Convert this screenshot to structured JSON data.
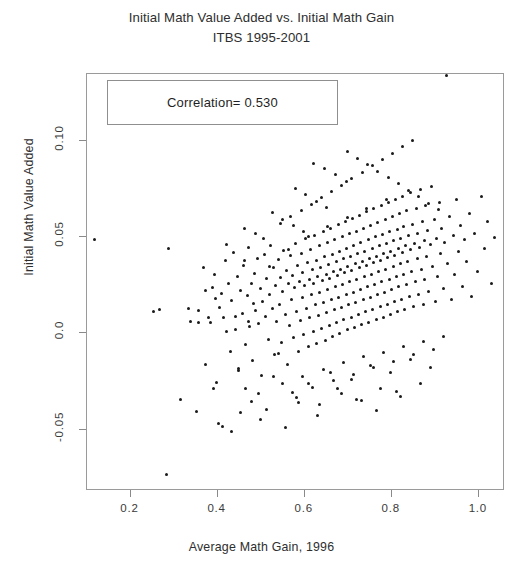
{
  "chart_data": {
    "type": "scatter",
    "title": "Initial Math Value Added vs. Initial Math Gain",
    "subtitle": "ITBS 1995-2001",
    "xlabel": "Average Math Gain, 1996",
    "ylabel": "Initial Math Value Added",
    "xlim": [
      0.1,
      1.06
    ],
    "ylim": [
      -0.082,
      0.135
    ],
    "xticks": [
      0.2,
      0.4,
      0.6,
      0.8,
      1.0
    ],
    "xticklabels": [
      "0.2",
      "0.4",
      "0.6",
      "0.8",
      "1.0"
    ],
    "yticks": [
      -0.05,
      0.0,
      0.05,
      0.1
    ],
    "yticklabels": [
      "-0.05",
      "0.0",
      "0.05",
      "0.10"
    ],
    "grid": false,
    "legend": null,
    "annotations": [
      {
        "name": "correlation-box",
        "text": "Correlation= 0.530",
        "x_px": 107,
        "y_px": 80,
        "w_px": 231,
        "h_px": 45
      }
    ],
    "marker": {
      "shape": "circle",
      "size_px": 3,
      "color": "#1a1a1a"
    },
    "frame_color": "#9a9a9a",
    "background": "#ffffff",
    "n_points": 381,
    "correlation": 0.53,
    "points": [
      [
        0.118,
        0.0487
      ],
      [
        0.288,
        0.0443
      ],
      [
        0.283,
        -0.0735
      ],
      [
        0.315,
        -0.0345
      ],
      [
        0.352,
        -0.0404
      ],
      [
        0.372,
        -0.0161
      ],
      [
        0.383,
        0.0058
      ],
      [
        0.388,
        0.0239
      ],
      [
        0.392,
        0.0305
      ],
      [
        0.398,
        -0.0255
      ],
      [
        0.404,
        0.0135
      ],
      [
        0.409,
        0.021
      ],
      [
        0.413,
        0.0082
      ],
      [
        0.418,
        0.0378
      ],
      [
        0.421,
        0.0008
      ],
      [
        0.425,
        0.0262
      ],
      [
        0.429,
        -0.0095
      ],
      [
        0.433,
        0.017
      ],
      [
        0.437,
        0.042
      ],
      [
        0.441,
        0.0018
      ],
      [
        0.445,
        0.0298
      ],
      [
        0.449,
        -0.018
      ],
      [
        0.452,
        0.0225
      ],
      [
        0.456,
        0.0104
      ],
      [
        0.46,
        0.0355
      ],
      [
        0.464,
        -0.006
      ],
      [
        0.468,
        0.0198
      ],
      [
        0.47,
        0.0445
      ],
      [
        0.474,
        0.0036
      ],
      [
        0.478,
        0.026
      ],
      [
        0.481,
        -0.014
      ],
      [
        0.485,
        0.0312
      ],
      [
        0.488,
        0.012
      ],
      [
        0.492,
        0.0392
      ],
      [
        0.495,
        0.0052
      ],
      [
        0.498,
        0.0232
      ],
      [
        0.501,
        -0.0218
      ],
      [
        0.504,
        0.0168
      ],
      [
        0.507,
        0.041
      ],
      [
        0.51,
        0.0088
      ],
      [
        0.513,
        0.0288
      ],
      [
        0.516,
        -0.0032
      ],
      [
        0.519,
        0.0205
      ],
      [
        0.522,
        0.046
      ],
      [
        0.525,
        0.0128
      ],
      [
        0.528,
        0.0342
      ],
      [
        0.531,
        -0.0108
      ],
      [
        0.534,
        0.0248
      ],
      [
        0.536,
        0.0062
      ],
      [
        0.539,
        0.0385
      ],
      [
        0.542,
        0.0152
      ],
      [
        0.545,
        0.0292
      ],
      [
        0.547,
        -0.0048
      ],
      [
        0.55,
        0.0218
      ],
      [
        0.552,
        0.0432
      ],
      [
        0.555,
        0.0098
      ],
      [
        0.558,
        0.0328
      ],
      [
        0.56,
        -0.0162
      ],
      [
        0.562,
        0.0258
      ],
      [
        0.565,
        0.0042
      ],
      [
        0.567,
        0.0405
      ],
      [
        0.57,
        0.0178
      ],
      [
        0.572,
        0.0302
      ],
      [
        0.574,
        -0.0022
      ],
      [
        0.577,
        0.0238
      ],
      [
        0.579,
        0.0468
      ],
      [
        0.581,
        0.0112
      ],
      [
        0.583,
        0.0352
      ],
      [
        0.586,
        -0.0092
      ],
      [
        0.588,
        0.0272
      ],
      [
        0.59,
        0.0068
      ],
      [
        0.592,
        0.0418
      ],
      [
        0.594,
        0.0188
      ],
      [
        0.596,
        0.0315
      ],
      [
        0.598,
        -0.0005
      ],
      [
        0.6,
        0.0248
      ],
      [
        0.602,
        0.0492
      ],
      [
        0.604,
        0.0132
      ],
      [
        0.606,
        0.0368
      ],
      [
        0.608,
        -0.007
      ],
      [
        0.61,
        0.0282
      ],
      [
        0.612,
        0.0082
      ],
      [
        0.614,
        0.0438
      ],
      [
        0.616,
        0.0202
      ],
      [
        0.618,
        0.0332
      ],
      [
        0.62,
        0.0012
      ],
      [
        0.621,
        0.0262
      ],
      [
        0.623,
        0.0512
      ],
      [
        0.625,
        0.0148
      ],
      [
        0.627,
        0.0382
      ],
      [
        0.628,
        -0.0052
      ],
      [
        0.63,
        0.0298
      ],
      [
        0.632,
        0.0095
      ],
      [
        0.634,
        0.0455
      ],
      [
        0.635,
        0.0215
      ],
      [
        0.637,
        0.0345
      ],
      [
        0.639,
        0.0028
      ],
      [
        0.64,
        0.0275
      ],
      [
        0.642,
        0.053
      ],
      [
        0.644,
        0.0162
      ],
      [
        0.645,
        0.0398
      ],
      [
        0.647,
        -0.0035
      ],
      [
        0.649,
        0.0308
      ],
      [
        0.65,
        0.0108
      ],
      [
        0.652,
        0.0472
      ],
      [
        0.653,
        0.0228
      ],
      [
        0.655,
        0.0358
      ],
      [
        0.657,
        0.0042
      ],
      [
        0.658,
        0.0288
      ],
      [
        0.66,
        0.0548
      ],
      [
        0.661,
        0.0175
      ],
      [
        0.663,
        0.0412
      ],
      [
        0.664,
        -0.0018
      ],
      [
        0.666,
        0.0322
      ],
      [
        0.668,
        0.0122
      ],
      [
        0.669,
        0.0488
      ],
      [
        0.671,
        0.0242
      ],
      [
        0.672,
        0.0372
      ],
      [
        0.674,
        0.0058
      ],
      [
        0.675,
        0.0302
      ],
      [
        0.677,
        0.0565
      ],
      [
        0.678,
        0.0188
      ],
      [
        0.68,
        0.0428
      ],
      [
        0.681,
        0.0002
      ],
      [
        0.683,
        0.0335
      ],
      [
        0.684,
        0.0135
      ],
      [
        0.686,
        0.0502
      ],
      [
        0.687,
        0.0255
      ],
      [
        0.689,
        0.0388
      ],
      [
        0.69,
        0.0072
      ],
      [
        0.692,
        0.0315
      ],
      [
        0.693,
        0.0582
      ],
      [
        0.695,
        0.0202
      ],
      [
        0.696,
        0.0442
      ],
      [
        0.698,
        0.0018
      ],
      [
        0.699,
        0.0348
      ],
      [
        0.701,
        0.0148
      ],
      [
        0.702,
        0.0518
      ],
      [
        0.704,
        0.0268
      ],
      [
        0.705,
        0.0402
      ],
      [
        0.707,
        0.0085
      ],
      [
        0.708,
        0.0328
      ],
      [
        0.71,
        0.0598
      ],
      [
        0.711,
        0.0215
      ],
      [
        0.713,
        0.0458
      ],
      [
        0.714,
        0.0032
      ],
      [
        0.716,
        0.0362
      ],
      [
        0.717,
        0.0162
      ],
      [
        0.719,
        0.0532
      ],
      [
        0.72,
        0.0282
      ],
      [
        0.722,
        0.0415
      ],
      [
        0.723,
        0.0098
      ],
      [
        0.725,
        0.0342
      ],
      [
        0.726,
        0.0615
      ],
      [
        0.728,
        0.0228
      ],
      [
        0.729,
        0.0472
      ],
      [
        0.731,
        0.0045
      ],
      [
        0.732,
        0.0375
      ],
      [
        0.734,
        0.0175
      ],
      [
        0.735,
        0.0548
      ],
      [
        0.737,
        0.0295
      ],
      [
        0.738,
        0.0428
      ],
      [
        0.74,
        0.0112
      ],
      [
        0.741,
        0.0355
      ],
      [
        0.743,
        0.0632
      ],
      [
        0.744,
        0.0242
      ],
      [
        0.746,
        0.0488
      ],
      [
        0.747,
        0.0058
      ],
      [
        0.749,
        0.0388
      ],
      [
        0.75,
        0.0188
      ],
      [
        0.752,
        0.0562
      ],
      [
        0.753,
        0.0308
      ],
      [
        0.755,
        0.0442
      ],
      [
        0.756,
        0.0125
      ],
      [
        0.758,
        0.0368
      ],
      [
        0.759,
        0.0648
      ],
      [
        0.761,
        0.0255
      ],
      [
        0.762,
        0.0502
      ],
      [
        0.764,
        0.0072
      ],
      [
        0.765,
        0.0402
      ],
      [
        0.767,
        0.0202
      ],
      [
        0.768,
        0.0578
      ],
      [
        0.77,
        0.0322
      ],
      [
        0.771,
        0.0455
      ],
      [
        0.773,
        0.0138
      ],
      [
        0.774,
        0.0382
      ],
      [
        0.776,
        0.0665
      ],
      [
        0.777,
        0.0268
      ],
      [
        0.779,
        0.0515
      ],
      [
        0.78,
        0.0085
      ],
      [
        0.782,
        0.0415
      ],
      [
        0.783,
        0.0215
      ],
      [
        0.785,
        0.0592
      ],
      [
        0.786,
        0.0335
      ],
      [
        0.788,
        0.0468
      ],
      [
        0.789,
        0.0152
      ],
      [
        0.791,
        0.0395
      ],
      [
        0.792,
        0.0682
      ],
      [
        0.794,
        0.0282
      ],
      [
        0.795,
        0.0528
      ],
      [
        0.797,
        0.0098
      ],
      [
        0.798,
        0.0428
      ],
      [
        0.8,
        0.0228
      ],
      [
        0.801,
        0.0608
      ],
      [
        0.803,
        0.0348
      ],
      [
        0.804,
        0.0482
      ],
      [
        0.806,
        0.0165
      ],
      [
        0.807,
        0.0408
      ],
      [
        0.809,
        0.0698
      ],
      [
        0.81,
        0.0295
      ],
      [
        0.812,
        0.0542
      ],
      [
        0.813,
        0.0112
      ],
      [
        0.815,
        0.0442
      ],
      [
        0.816,
        0.0242
      ],
      [
        0.818,
        0.0622
      ],
      [
        0.819,
        0.0362
      ],
      [
        0.821,
        0.0495
      ],
      [
        0.822,
        0.0178
      ],
      [
        0.824,
        0.0422
      ],
      [
        0.825,
        0.0715
      ],
      [
        0.827,
        0.0308
      ],
      [
        0.828,
        0.0555
      ],
      [
        0.83,
        0.0125
      ],
      [
        0.831,
        0.0455
      ],
      [
        0.833,
        0.0255
      ],
      [
        0.834,
        0.0638
      ],
      [
        0.836,
        0.0375
      ],
      [
        0.838,
        0.0508
      ],
      [
        0.84,
        0.0192
      ],
      [
        0.842,
        0.0435
      ],
      [
        0.844,
        0.0732
      ],
      [
        0.846,
        0.0322
      ],
      [
        0.848,
        0.0568
      ],
      [
        0.85,
        0.0138
      ],
      [
        0.852,
        0.0468
      ],
      [
        0.854,
        0.0268
      ],
      [
        0.856,
        0.0652
      ],
      [
        0.858,
        0.0388
      ],
      [
        0.86,
        0.0522
      ],
      [
        0.862,
        0.0205
      ],
      [
        0.864,
        0.0448
      ],
      [
        0.866,
        0.0748
      ],
      [
        0.868,
        0.0335
      ],
      [
        0.87,
        0.0582
      ],
      [
        0.872,
        0.0152
      ],
      [
        0.874,
        0.0482
      ],
      [
        0.876,
        0.0282
      ],
      [
        0.878,
        0.0668
      ],
      [
        0.88,
        0.0402
      ],
      [
        0.882,
        0.0535
      ],
      [
        0.885,
        0.0218
      ],
      [
        0.888,
        0.0462
      ],
      [
        0.891,
        0.0762
      ],
      [
        0.894,
        0.0348
      ],
      [
        0.897,
        0.0595
      ],
      [
        0.9,
        0.0165
      ],
      [
        0.903,
        0.0495
      ],
      [
        0.906,
        0.0295
      ],
      [
        0.909,
        0.0682
      ],
      [
        0.912,
        0.0415
      ],
      [
        0.915,
        0.0548
      ],
      [
        0.918,
        0.0232
      ],
      [
        0.921,
        0.0475
      ],
      [
        0.925,
        0.1342
      ],
      [
        0.929,
        0.0362
      ],
      [
        0.933,
        0.0608
      ],
      [
        0.937,
        0.0178
      ],
      [
        0.941,
        0.0508
      ],
      [
        0.945,
        0.0308
      ],
      [
        0.949,
        0.0698
      ],
      [
        0.953,
        0.0428
      ],
      [
        0.957,
        0.0562
      ],
      [
        0.962,
        0.0245
      ],
      [
        0.967,
        0.0488
      ],
      [
        0.972,
        0.0375
      ],
      [
        0.978,
        0.0622
      ],
      [
        0.984,
        0.0192
      ],
      [
        0.99,
        0.0522
      ],
      [
        0.997,
        0.0322
      ],
      [
        1.005,
        0.0712
      ],
      [
        1.012,
        0.0442
      ],
      [
        1.02,
        0.0582
      ],
      [
        1.028,
        0.0258
      ],
      [
        1.036,
        0.05
      ],
      [
        0.452,
        -0.0412
      ],
      [
        0.478,
        -0.0352
      ],
      [
        0.512,
        -0.0398
      ],
      [
        0.548,
        -0.0262
      ],
      [
        0.572,
        -0.0305
      ],
      [
        0.596,
        -0.0222
      ],
      [
        0.618,
        -0.0282
      ],
      [
        0.642,
        -0.0188
      ],
      [
        0.665,
        -0.0245
      ],
      [
        0.688,
        -0.0152
      ],
      [
        0.712,
        -0.0215
      ],
      [
        0.735,
        -0.0122
      ],
      [
        0.758,
        -0.0178
      ],
      [
        0.782,
        -0.0098
      ],
      [
        0.805,
        -0.0145
      ],
      [
        0.828,
        -0.0068
      ],
      [
        0.85,
        -0.0112
      ],
      [
        0.872,
        -0.0042
      ],
      [
        0.895,
        -0.0085
      ],
      [
        0.918,
        -0.0018
      ],
      [
        0.402,
        -0.0468
      ],
      [
        0.432,
        -0.0508
      ],
      [
        0.465,
        -0.0288
      ],
      [
        0.498,
        -0.0448
      ],
      [
        0.528,
        -0.0222
      ],
      [
        0.555,
        -0.0492
      ],
      [
        0.582,
        -0.0335
      ],
      [
        0.608,
        -0.0258
      ],
      [
        0.635,
        -0.0368
      ],
      [
        0.66,
        -0.0202
      ],
      [
        0.685,
        -0.0312
      ],
      [
        0.708,
        -0.0238
      ],
      [
        0.73,
        -0.0348
      ],
      [
        0.752,
        -0.0168
      ],
      [
        0.775,
        -0.0288
      ],
      [
        0.798,
        -0.0205
      ],
      [
        0.82,
        -0.0328
      ],
      [
        0.842,
        -0.0135
      ],
      [
        0.865,
        -0.0262
      ],
      [
        0.888,
        -0.0178
      ],
      [
        0.355,
        0.0118
      ],
      [
        0.368,
        0.0345
      ],
      [
        0.395,
        0.0182
      ],
      [
        0.42,
        0.0462
      ],
      [
        0.44,
        0.0088
      ],
      [
        0.462,
        0.0382
      ],
      [
        0.482,
        0.0158
      ],
      [
        0.505,
        0.0495
      ],
      [
        0.252,
        0.0115
      ],
      [
        0.266,
        0.0122
      ],
      [
        0.332,
        0.0128
      ],
      [
        0.338,
        0.0062
      ],
      [
        0.355,
        0.0055
      ],
      [
        0.378,
        0.0085
      ],
      [
        0.462,
        0.0545
      ],
      [
        0.488,
        0.0522
      ],
      [
        0.545,
        0.0572
      ],
      [
        0.568,
        0.0608
      ],
      [
        0.592,
        0.0638
      ],
      [
        0.615,
        0.0672
      ],
      [
        0.638,
        0.0705
      ],
      [
        0.662,
        0.0738
      ],
      [
        0.685,
        0.0772
      ],
      [
        0.708,
        0.0805
      ],
      [
        0.732,
        0.0838
      ],
      [
        0.755,
        0.0872
      ],
      [
        0.778,
        0.0905
      ],
      [
        0.802,
        0.0938
      ],
      [
        0.825,
        0.0972
      ],
      [
        0.848,
        0.1005
      ],
      [
        0.698,
        0.0945
      ],
      [
        0.722,
        0.0912
      ],
      [
        0.745,
        0.0878
      ],
      [
        0.768,
        0.0845
      ],
      [
        0.792,
        0.0812
      ],
      [
        0.815,
        0.0778
      ],
      [
        0.838,
        0.0745
      ],
      [
        0.862,
        0.0712
      ],
      [
        0.885,
        0.0678
      ],
      [
        0.908,
        0.0645
      ],
      [
        0.62,
        0.0882
      ],
      [
        0.645,
        0.0858
      ],
      [
        0.67,
        0.0825
      ],
      [
        0.695,
        0.0792
      ],
      [
        0.578,
        0.0755
      ],
      [
        0.602,
        0.0722
      ],
      [
        0.626,
        0.0688
      ],
      [
        0.65,
        0.0655
      ],
      [
        0.525,
        0.0628
      ],
      [
        0.55,
        0.0595
      ],
      [
        0.574,
        0.0562
      ],
      [
        0.598,
        0.0528
      ],
      [
        0.372,
        0.0222
      ],
      [
        0.39,
        -0.0285
      ],
      [
        0.412,
        -0.0482
      ],
      [
        0.448,
        -0.0195
      ],
      [
        0.472,
        0.0062
      ],
      [
        0.495,
        -0.0312
      ],
      [
        0.518,
        0.0348
      ],
      [
        0.54,
        -0.0102
      ],
      [
        0.562,
        0.0438
      ],
      [
        0.585,
        -0.0362
      ],
      [
        0.608,
        0.0505
      ],
      [
        0.63,
        -0.0425
      ],
      [
        0.652,
        0.0555
      ],
      [
        0.675,
        -0.0285
      ],
      [
        0.698,
        0.0605
      ],
      [
        0.72,
        -0.0345
      ],
      [
        0.742,
        0.0652
      ],
      [
        0.765,
        -0.0402
      ],
      [
        0.788,
        0.0698
      ],
      [
        0.81,
        -0.0302
      ]
    ]
  }
}
